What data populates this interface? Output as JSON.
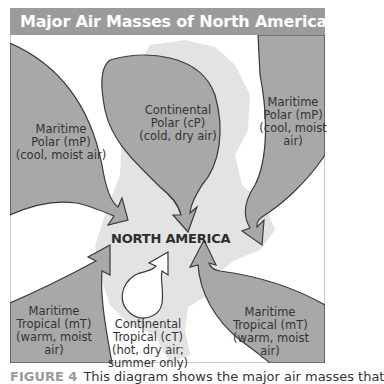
{
  "figure": {
    "title": "Major Air Masses of North America",
    "center_label": "NORTH AMERICA",
    "caption_figure": "FIGURE 4",
    "caption_text": "This diagram shows the major air masses that"
  },
  "air_masses": [
    {
      "id": "mp-west",
      "line1": "Maritime",
      "line2": "Polar (mP)",
      "line3": "(cool, moist air)",
      "line4": ""
    },
    {
      "id": "cp",
      "line1": "Continental",
      "line2": "Polar (cP)",
      "line3": "(cold, dry air)",
      "line4": ""
    },
    {
      "id": "mp-east",
      "line1": "Maritime",
      "line2": "Polar (mP)",
      "line3": "(cool, moist",
      "line4": "air)"
    },
    {
      "id": "mt-west",
      "line1": "Maritime",
      "line2": "Tropical (mT)",
      "line3": "(warm, moist",
      "line4": "air)"
    },
    {
      "id": "ct",
      "line1": "Continental",
      "line2": "Tropical (cT)",
      "line3": "(hot, dry air;",
      "line4": "summer only)"
    },
    {
      "id": "mt-east",
      "line1": "Maritime",
      "line2": "Tropical (mT)",
      "line3": "(warm, moist",
      "line4": "air)"
    }
  ],
  "colors": {
    "title_bar": "#9b9b9b",
    "air_mass_fill": "#a8a8a8",
    "land_fill": "#e3e3e3",
    "outline": "#3a3a3a",
    "caption_figure": "#9a9a9a"
  }
}
